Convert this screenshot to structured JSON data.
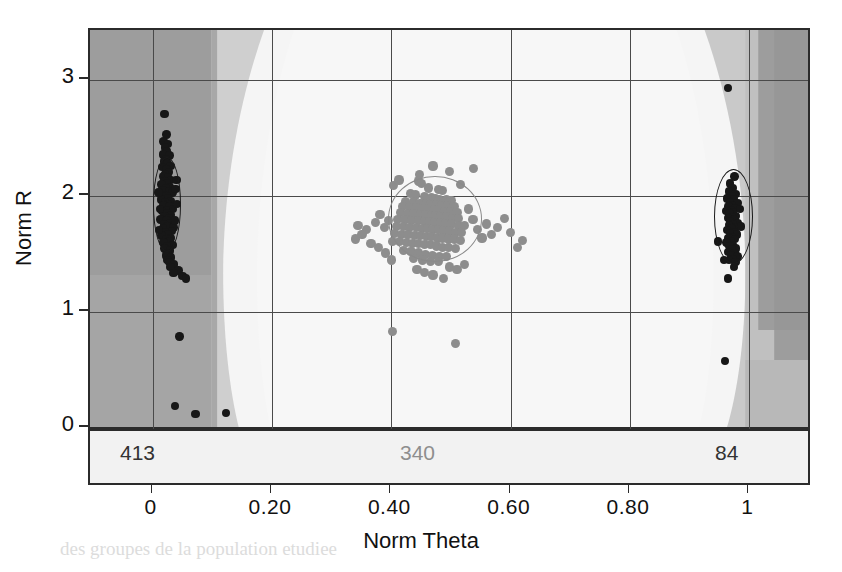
{
  "chart_data": {
    "type": "scatter",
    "title": "",
    "xlabel": "Norm Theta",
    "ylabel": "Norm R",
    "xlim": [
      -0.105,
      1.105
    ],
    "ylim": [
      -0.78,
      3.55
    ],
    "xticks": [
      0,
      0.2,
      0.4,
      0.6,
      0.8,
      1
    ],
    "xticklabels": [
      "0",
      "0.20",
      "0.40",
      "0.60",
      "0.80",
      "1"
    ],
    "yticks": [
      0,
      1,
      2,
      3
    ],
    "yticklabels": [
      "0",
      "1",
      "2",
      "3"
    ],
    "grid": true,
    "legend": null,
    "background": "classification decision regions, grayscale bands",
    "annotations": [
      {
        "text": "413",
        "x": -0.018,
        "y": -0.32,
        "color": "#333333",
        "group": "left-cluster-count"
      },
      {
        "text": "340",
        "x": 0.425,
        "y": -0.32,
        "color": "#8e8e8e",
        "group": "center-cluster-count"
      },
      {
        "text": "84",
        "x": 0.952,
        "y": -0.32,
        "color": "#333333",
        "group": "right-cluster-count"
      }
    ],
    "series": [
      {
        "name": "left-cluster",
        "count": 413,
        "color": "#171717",
        "marker": "o",
        "ellipse": {
          "cx": 0.022,
          "cy": 1.93,
          "rx": 0.022,
          "ry": 0.4,
          "color": "#1a1a1a"
        },
        "points": [
          [
            0.02,
            2.7
          ],
          [
            0.023,
            2.52
          ],
          [
            0.018,
            2.46
          ],
          [
            0.026,
            2.44
          ],
          [
            0.021,
            2.41
          ],
          [
            0.024,
            2.38
          ],
          [
            0.017,
            2.35
          ],
          [
            0.028,
            2.34
          ],
          [
            0.022,
            2.31
          ],
          [
            0.019,
            2.29
          ],
          [
            0.025,
            2.27
          ],
          [
            0.03,
            2.25
          ],
          [
            0.016,
            2.24
          ],
          [
            0.023,
            2.22
          ],
          [
            0.027,
            2.2
          ],
          [
            0.021,
            2.18
          ],
          [
            0.018,
            2.16
          ],
          [
            0.026,
            2.15
          ],
          [
            0.031,
            2.13
          ],
          [
            0.02,
            2.12
          ],
          [
            0.024,
            2.1
          ],
          [
            0.015,
            2.09
          ],
          [
            0.029,
            2.07
          ],
          [
            0.022,
            2.06
          ],
          [
            0.017,
            2.04
          ],
          [
            0.027,
            2.03
          ],
          [
            0.033,
            2.02
          ],
          [
            0.019,
            2.0
          ],
          [
            0.023,
            1.99
          ],
          [
            0.026,
            1.97
          ],
          [
            0.014,
            1.96
          ],
          [
            0.03,
            1.95
          ],
          [
            0.021,
            1.94
          ],
          [
            0.025,
            1.92
          ],
          [
            0.018,
            1.91
          ],
          [
            0.028,
            1.9
          ],
          [
            0.034,
            1.88
          ],
          [
            0.022,
            1.87
          ],
          [
            0.016,
            1.86
          ],
          [
            0.024,
            1.84
          ],
          [
            0.031,
            1.83
          ],
          [
            0.02,
            1.82
          ],
          [
            0.027,
            1.8
          ],
          [
            0.013,
            1.79
          ],
          [
            0.023,
            1.78
          ],
          [
            0.029,
            1.76
          ],
          [
            0.019,
            1.75
          ],
          [
            0.025,
            1.73
          ],
          [
            0.035,
            1.72
          ],
          [
            0.017,
            1.71
          ],
          [
            0.032,
            1.69
          ],
          [
            0.021,
            1.68
          ],
          [
            0.026,
            1.66
          ],
          [
            0.015,
            1.65
          ],
          [
            0.03,
            1.63
          ],
          [
            0.023,
            1.62
          ],
          [
            0.028,
            1.6
          ],
          [
            0.018,
            1.59
          ],
          [
            0.033,
            1.57
          ],
          [
            0.024,
            1.56
          ],
          [
            0.02,
            1.54
          ],
          [
            0.029,
            1.52
          ],
          [
            0.026,
            1.5
          ],
          [
            0.022,
            1.48
          ],
          [
            0.031,
            1.46
          ],
          [
            0.025,
            1.44
          ],
          [
            0.027,
            1.42
          ],
          [
            0.036,
            1.4
          ],
          [
            0.03,
            1.38
          ],
          [
            0.04,
            2.13
          ],
          [
            0.043,
            1.35
          ],
          [
            0.05,
            1.3
          ],
          [
            0.056,
            1.28
          ],
          [
            0.035,
            1.33
          ],
          [
            0.012,
            1.88
          ],
          [
            0.011,
            1.7
          ],
          [
            0.038,
            2.05
          ],
          [
            0.041,
            1.92
          ],
          [
            0.01,
            2.02
          ],
          [
            0.037,
            1.78
          ],
          [
            0.045,
            0.78
          ],
          [
            0.037,
            0.18
          ],
          [
            0.072,
            0.11
          ],
          [
            0.123,
            0.12
          ]
        ]
      },
      {
        "name": "center-cluster",
        "count": 340,
        "color": "#8d8d8d",
        "marker": "o",
        "ellipse": {
          "cx": 0.472,
          "cy": 1.8,
          "rx": 0.077,
          "ry": 0.36,
          "color": "#8a8a8a"
        },
        "points": [
          [
            0.47,
            2.25
          ],
          [
            0.497,
            2.2
          ],
          [
            0.538,
            2.23
          ],
          [
            0.445,
            2.12
          ],
          [
            0.451,
            2.1
          ],
          [
            0.462,
            2.06
          ],
          [
            0.479,
            2.05
          ],
          [
            0.486,
            2.04
          ],
          [
            0.432,
            2.01
          ],
          [
            0.44,
            2.0
          ],
          [
            0.455,
            1.99
          ],
          [
            0.468,
            1.98
          ],
          [
            0.474,
            1.97
          ],
          [
            0.481,
            1.96
          ],
          [
            0.492,
            1.96
          ],
          [
            0.5,
            1.95
          ],
          [
            0.424,
            1.94
          ],
          [
            0.437,
            1.94
          ],
          [
            0.448,
            1.93
          ],
          [
            0.459,
            1.93
          ],
          [
            0.466,
            1.92
          ],
          [
            0.476,
            1.92
          ],
          [
            0.484,
            1.91
          ],
          [
            0.494,
            1.91
          ],
          [
            0.505,
            1.9
          ],
          [
            0.419,
            1.9
          ],
          [
            0.431,
            1.89
          ],
          [
            0.442,
            1.89
          ],
          [
            0.453,
            1.88
          ],
          [
            0.463,
            1.88
          ],
          [
            0.472,
            1.87
          ],
          [
            0.48,
            1.87
          ],
          [
            0.489,
            1.86
          ],
          [
            0.499,
            1.86
          ],
          [
            0.51,
            1.85
          ],
          [
            0.415,
            1.85
          ],
          [
            0.427,
            1.84
          ],
          [
            0.438,
            1.84
          ],
          [
            0.449,
            1.83
          ],
          [
            0.458,
            1.83
          ],
          [
            0.467,
            1.82
          ],
          [
            0.475,
            1.82
          ],
          [
            0.483,
            1.81
          ],
          [
            0.492,
            1.81
          ],
          [
            0.502,
            1.8
          ],
          [
            0.513,
            1.8
          ],
          [
            0.411,
            1.79
          ],
          [
            0.423,
            1.79
          ],
          [
            0.434,
            1.78
          ],
          [
            0.445,
            1.78
          ],
          [
            0.455,
            1.77
          ],
          [
            0.464,
            1.77
          ],
          [
            0.473,
            1.76
          ],
          [
            0.482,
            1.76
          ],
          [
            0.491,
            1.75
          ],
          [
            0.501,
            1.75
          ],
          [
            0.512,
            1.74
          ],
          [
            0.522,
            1.74
          ],
          [
            0.408,
            1.73
          ],
          [
            0.42,
            1.73
          ],
          [
            0.431,
            1.72
          ],
          [
            0.442,
            1.72
          ],
          [
            0.452,
            1.71
          ],
          [
            0.461,
            1.71
          ],
          [
            0.47,
            1.7
          ],
          [
            0.479,
            1.7
          ],
          [
            0.488,
            1.69
          ],
          [
            0.498,
            1.69
          ],
          [
            0.508,
            1.68
          ],
          [
            0.518,
            1.68
          ],
          [
            0.405,
            1.67
          ],
          [
            0.417,
            1.66
          ],
          [
            0.428,
            1.66
          ],
          [
            0.439,
            1.65
          ],
          [
            0.449,
            1.65
          ],
          [
            0.459,
            1.64
          ],
          [
            0.468,
            1.64
          ],
          [
            0.477,
            1.63
          ],
          [
            0.486,
            1.63
          ],
          [
            0.496,
            1.62
          ],
          [
            0.506,
            1.62
          ],
          [
            0.516,
            1.61
          ],
          [
            0.402,
            1.6
          ],
          [
            0.414,
            1.6
          ],
          [
            0.425,
            1.59
          ],
          [
            0.436,
            1.58
          ],
          [
            0.446,
            1.58
          ],
          [
            0.456,
            1.57
          ],
          [
            0.466,
            1.57
          ],
          [
            0.476,
            1.56
          ],
          [
            0.486,
            1.55
          ],
          [
            0.496,
            1.55
          ],
          [
            0.507,
            1.54
          ],
          [
            0.42,
            1.52
          ],
          [
            0.433,
            1.51
          ],
          [
            0.445,
            1.5
          ],
          [
            0.457,
            1.49
          ],
          [
            0.469,
            1.48
          ],
          [
            0.481,
            1.47
          ],
          [
            0.493,
            1.47
          ],
          [
            0.437,
            1.45
          ],
          [
            0.452,
            1.44
          ],
          [
            0.466,
            1.43
          ],
          [
            0.479,
            1.43
          ],
          [
            0.395,
            1.78
          ],
          [
            0.388,
            1.72
          ],
          [
            0.381,
            1.83
          ],
          [
            0.374,
            1.76
          ],
          [
            0.53,
            1.88
          ],
          [
            0.537,
            1.79
          ],
          [
            0.545,
            1.7
          ],
          [
            0.552,
            1.63
          ],
          [
            0.56,
            1.75
          ],
          [
            0.568,
            1.66
          ],
          [
            0.404,
            2.08
          ],
          [
            0.413,
            2.13
          ],
          [
            0.358,
            1.7
          ],
          [
            0.351,
            1.66
          ],
          [
            0.344,
            1.74
          ],
          [
            0.366,
            1.58
          ],
          [
            0.497,
            1.38
          ],
          [
            0.51,
            1.36
          ],
          [
            0.523,
            1.4
          ],
          [
            0.443,
            1.36
          ],
          [
            0.456,
            1.33
          ],
          [
            0.47,
            1.31
          ],
          [
            0.487,
            1.28
          ],
          [
            0.578,
            1.72
          ],
          [
            0.59,
            1.8
          ],
          [
            0.6,
            1.68
          ],
          [
            0.612,
            1.55
          ],
          [
            0.4,
            1.44
          ],
          [
            0.39,
            1.5
          ],
          [
            0.378,
            1.55
          ],
          [
            0.62,
            1.61
          ],
          [
            0.402,
            0.82
          ],
          [
            0.508,
            0.72
          ],
          [
            0.447,
            2.18
          ],
          [
            0.516,
            2.09
          ],
          [
            0.34,
            1.62
          ]
        ]
      },
      {
        "name": "right-cluster",
        "count": 84,
        "color": "#171717",
        "marker": "o",
        "ellipse": {
          "cx": 0.971,
          "cy": 1.82,
          "rx": 0.031,
          "ry": 0.4,
          "color": "#1a1a1a"
        },
        "points": [
          [
            0.964,
            2.92
          ],
          [
            0.975,
            2.16
          ],
          [
            0.968,
            2.1
          ],
          [
            0.972,
            2.06
          ],
          [
            0.966,
            2.03
          ],
          [
            0.977,
            2.01
          ],
          [
            0.97,
            1.99
          ],
          [
            0.963,
            1.97
          ],
          [
            0.974,
            1.96
          ],
          [
            0.968,
            1.94
          ],
          [
            0.98,
            1.93
          ],
          [
            0.971,
            1.91
          ],
          [
            0.965,
            1.9
          ],
          [
            0.976,
            1.89
          ],
          [
            0.969,
            1.87
          ],
          [
            0.962,
            1.86
          ],
          [
            0.973,
            1.85
          ],
          [
            0.967,
            1.84
          ],
          [
            0.978,
            1.82
          ],
          [
            0.97,
            1.81
          ],
          [
            0.964,
            1.8
          ],
          [
            0.975,
            1.79
          ],
          [
            0.968,
            1.77
          ],
          [
            0.981,
            1.76
          ],
          [
            0.972,
            1.75
          ],
          [
            0.966,
            1.74
          ],
          [
            0.977,
            1.72
          ],
          [
            0.97,
            1.71
          ],
          [
            0.963,
            1.7
          ],
          [
            0.974,
            1.68
          ],
          [
            0.968,
            1.67
          ],
          [
            0.979,
            1.66
          ],
          [
            0.971,
            1.64
          ],
          [
            0.965,
            1.63
          ],
          [
            0.976,
            1.62
          ],
          [
            0.969,
            1.6
          ],
          [
            0.962,
            1.59
          ],
          [
            0.973,
            1.57
          ],
          [
            0.967,
            1.56
          ],
          [
            0.978,
            1.54
          ],
          [
            0.971,
            1.53
          ],
          [
            0.964,
            1.51
          ],
          [
            0.975,
            1.5
          ],
          [
            0.969,
            1.48
          ],
          [
            0.98,
            1.47
          ],
          [
            0.972,
            1.45
          ],
          [
            0.966,
            1.44
          ],
          [
            0.977,
            1.42
          ],
          [
            0.947,
            1.6
          ],
          [
            0.984,
            1.88
          ],
          [
            0.986,
            1.73
          ],
          [
            0.958,
            1.44
          ],
          [
            0.974,
            1.38
          ],
          [
            0.964,
            1.28
          ],
          [
            0.959,
            0.57
          ]
        ]
      }
    ]
  },
  "axis": {
    "xlabel": "Norm Theta",
    "ylabel": "Norm R"
  },
  "counts": {
    "left": "413",
    "center": "340",
    "right": "84"
  },
  "bleed_text": {
    "l1": "a partir de ces donnees on obtient",
    "l2": "les classes suivantes pour chacun",
    "l3": "des groupes de la population etudiee",
    "l4": "et les resultats obtenus sont"
  }
}
